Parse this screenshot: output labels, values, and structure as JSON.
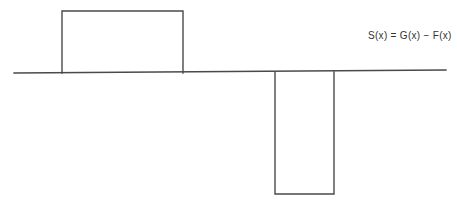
{
  "diagram": {
    "equation_label": "S(x) = G(x) − F(x)",
    "baseline": {
      "x1": 14,
      "y1": 73,
      "x2": 446,
      "y2": 70
    },
    "positive_pulse": {
      "x_left": 62,
      "x_right": 183,
      "y_top": 11,
      "y_base": 73
    },
    "negative_pulse": {
      "x_left": 275,
      "x_right": 334,
      "y_base": 72,
      "y_bottom": 194
    },
    "line_color": "#4a4a4a"
  }
}
